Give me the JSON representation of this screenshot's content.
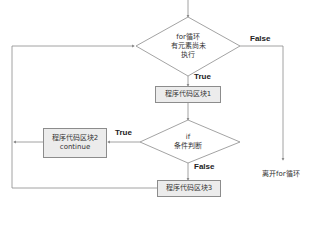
{
  "diagram": {
    "type": "flowchart",
    "nodes": {
      "loop_check": {
        "shape": "diamond",
        "lines": [
          "for循环",
          "有元素尚未",
          "执行"
        ]
      },
      "block1": {
        "shape": "rect",
        "label": "程序代码区块1"
      },
      "if_check": {
        "shape": "diamond",
        "lines": [
          "if",
          "条件判断"
        ]
      },
      "block2": {
        "shape": "rect",
        "label": "程序代码区块2",
        "sublabel": "continue"
      },
      "block3": {
        "shape": "rect",
        "label": "程序代码区块3"
      },
      "exit": {
        "shape": "text",
        "label": "离开for循环"
      }
    },
    "edges": {
      "loop_true": "True",
      "loop_false": "False",
      "if_true": "True",
      "if_false": "False"
    },
    "colors": {
      "line": "#8c8c8c",
      "box_fill": "#ececec",
      "text": "#333333"
    }
  }
}
